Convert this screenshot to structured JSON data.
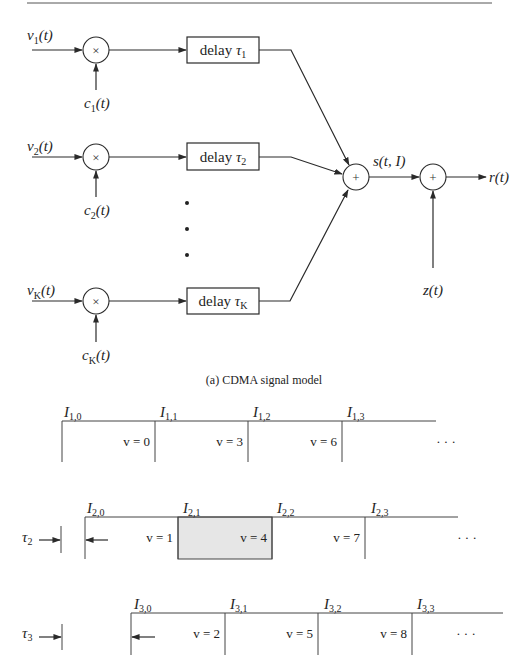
{
  "figure": {
    "part_a": {
      "caption": "(a) CDMA signal model",
      "users": [
        {
          "input": "v",
          "input_sub": "1",
          "code": "c",
          "code_sub": "1",
          "delay_label": "delay",
          "tau_sub": "1"
        },
        {
          "input": "v",
          "input_sub": "2",
          "code": "c",
          "code_sub": "2",
          "delay_label": "delay",
          "tau_sub": "2"
        },
        {
          "input": "v",
          "input_sub": "K",
          "code": "c",
          "code_sub": "K",
          "delay_label": "delay",
          "tau_sub": "K"
        }
      ],
      "arg_t": "(t)",
      "multiply_symbol": "×",
      "sum_symbol": "+",
      "tau_symbol": "τ",
      "ellipsis_dots": "•",
      "sum_output_label": "s(t, I)",
      "noise_label": "z(t)",
      "output_label": "r(t)"
    },
    "part_b": {
      "symbol_letter": "I",
      "rows": [
        {
          "user": "1",
          "offset_label": null,
          "intervals": [
            {
              "label_sub": "1,0",
              "v": "v = 0"
            },
            {
              "label_sub": "1,1",
              "v": "v = 3"
            },
            {
              "label_sub": "1,2",
              "v": "v = 6"
            },
            {
              "label_sub": "1,3",
              "v": "· · ·"
            }
          ]
        },
        {
          "user": "2",
          "offset_label": "τ",
          "offset_sub": "2",
          "intervals": [
            {
              "label_sub": "2,0",
              "v": "v = 1"
            },
            {
              "label_sub": "2,1",
              "v": "v = 4",
              "highlighted": true
            },
            {
              "label_sub": "2,2",
              "v": "v = 7"
            },
            {
              "label_sub": "2,3",
              "v": "· · ·"
            }
          ]
        },
        {
          "user": "3",
          "offset_label": "τ",
          "offset_sub": "3",
          "intervals": [
            {
              "label_sub": "3,0",
              "v": "v = 2"
            },
            {
              "label_sub": "3,1",
              "v": "v = 5"
            },
            {
              "label_sub": "3,2",
              "v": "v = 8"
            },
            {
              "label_sub": "3,3",
              "v": "· · ·"
            }
          ]
        }
      ]
    },
    "colors": {
      "line": "#2a2a2a",
      "highlight_fill": "#e6e6e6",
      "background": "#ffffff"
    }
  }
}
